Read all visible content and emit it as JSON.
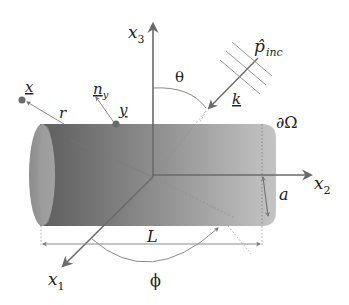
{
  "figure": {
    "colors": {
      "background": "#ffffff",
      "cylinder_dark": "#6e6e6e",
      "cylinder_light": "#bdbdbd",
      "axis": "#6a6a6a",
      "text": "#222222",
      "dotted": "#9a9a9a"
    }
  },
  "labels": {
    "x3_base": "x",
    "x3_sub": "3",
    "x2_base": "x",
    "x2_sub": "2",
    "x1_base": "x",
    "x1_sub": "1",
    "theta": "θ",
    "phi": "ϕ",
    "p_inc_base": "p̂",
    "p_inc_sub": "inc",
    "k": "k",
    "boundary": "∂Ω",
    "radius": "a",
    "length": "L",
    "field_point": "x",
    "distance": "r",
    "normal_base": "n",
    "normal_sub": "y",
    "surface_point": "y"
  }
}
